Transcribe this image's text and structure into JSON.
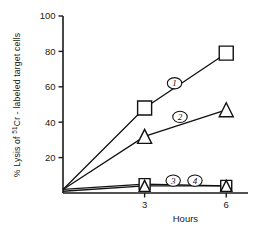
{
  "chart_data": {
    "type": "line",
    "title": "",
    "xlabel": "Hours",
    "ylabel": "% Lysis of 51Cr - labeled  target cells",
    "ylabel_prefix": "% Lysis of ",
    "ylabel_superscript": "51",
    "ylabel_suffix": "Cr - labeled  target cells",
    "x": [
      0,
      3,
      6
    ],
    "xlim": [
      0,
      6.8
    ],
    "ylim": [
      0,
      100
    ],
    "xticks": [
      "3",
      "6"
    ],
    "xtick_values": [
      3,
      6
    ],
    "yticks": [
      "20",
      "40",
      "60",
      "80",
      "100"
    ],
    "ytick_values": [
      20,
      40,
      60,
      80,
      100
    ],
    "grid": false,
    "legend": "inline-curve-labels",
    "series": [
      {
        "name": "1",
        "label": "1",
        "marker": "square",
        "values": [
          2,
          48,
          79
        ]
      },
      {
        "name": "2",
        "label": "2",
        "marker": "triangle",
        "values": [
          2,
          32,
          47
        ]
      },
      {
        "name": "3",
        "label": "3",
        "marker": "square",
        "values": [
          2,
          5,
          4
        ]
      },
      {
        "name": "4",
        "label": "4",
        "marker": "triangle",
        "values": [
          1,
          4,
          4
        ]
      }
    ],
    "annotations": [
      {
        "text": "1",
        "x": 4.1,
        "y": 62,
        "style": "circled-italic"
      },
      {
        "text": "2",
        "x": 4.3,
        "y": 43,
        "style": "circled-italic"
      },
      {
        "text": "3",
        "x": 4.05,
        "y": 7,
        "style": "circled-italic"
      },
      {
        "text": "4",
        "x": 4.85,
        "y": 7,
        "style": "circled-italic"
      }
    ],
    "colors": {
      "line": "#111111",
      "axis": "#1a1a1a",
      "marker_fill": "#ffffff",
      "background": "#ffffff"
    }
  }
}
